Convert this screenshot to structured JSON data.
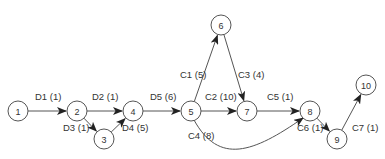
{
  "diagram": {
    "type": "activity-network",
    "nodes": [
      {
        "id": "1",
        "label": "1",
        "x": 18,
        "y": 111
      },
      {
        "id": "2",
        "label": "2",
        "x": 77,
        "y": 111
      },
      {
        "id": "3",
        "label": "3",
        "x": 104,
        "y": 139
      },
      {
        "id": "4",
        "label": "4",
        "x": 133,
        "y": 111
      },
      {
        "id": "5",
        "label": "5",
        "x": 191,
        "y": 111
      },
      {
        "id": "6",
        "label": "6",
        "x": 221,
        "y": 25
      },
      {
        "id": "7",
        "label": "7",
        "x": 247,
        "y": 111
      },
      {
        "id": "8",
        "label": "8",
        "x": 310,
        "y": 111
      },
      {
        "id": "9",
        "label": "9",
        "x": 337,
        "y": 139
      },
      {
        "id": "10",
        "label": "10",
        "x": 366,
        "y": 85
      }
    ],
    "edges": [
      {
        "from": "1",
        "to": "2",
        "label": "D1 (1)",
        "lx": 35,
        "ly": 100
      },
      {
        "from": "2",
        "to": "4",
        "label": "D2 (1)",
        "lx": 92,
        "ly": 100
      },
      {
        "from": "2",
        "to": "3",
        "label": "D3 (1)",
        "lx": 63,
        "ly": 131
      },
      {
        "from": "3",
        "to": "4",
        "label": "D4 (5)",
        "lx": 122,
        "ly": 131
      },
      {
        "from": "4",
        "to": "5",
        "label": "D5 (6)",
        "lx": 150,
        "ly": 100
      },
      {
        "from": "5",
        "to": "6",
        "label": "C1 (5)",
        "lx": 180,
        "ly": 78
      },
      {
        "from": "6",
        "to": "7",
        "label": "C3 (4)",
        "lx": 238,
        "ly": 78
      },
      {
        "from": "5",
        "to": "7",
        "label": "C2 (10)",
        "lx": 205,
        "ly": 100
      },
      {
        "from": "7",
        "to": "8",
        "label": "C5 (1)",
        "lx": 267,
        "ly": 100
      },
      {
        "from": "5",
        "to": "8",
        "label": "C4 (8)",
        "lx": 188,
        "ly": 139,
        "curved": true
      },
      {
        "from": "8",
        "to": "9",
        "label": "C6 (1)",
        "lx": 297,
        "ly": 131
      },
      {
        "from": "9",
        "to": "10",
        "label": "C7 (1)",
        "lx": 352,
        "ly": 131
      }
    ]
  }
}
